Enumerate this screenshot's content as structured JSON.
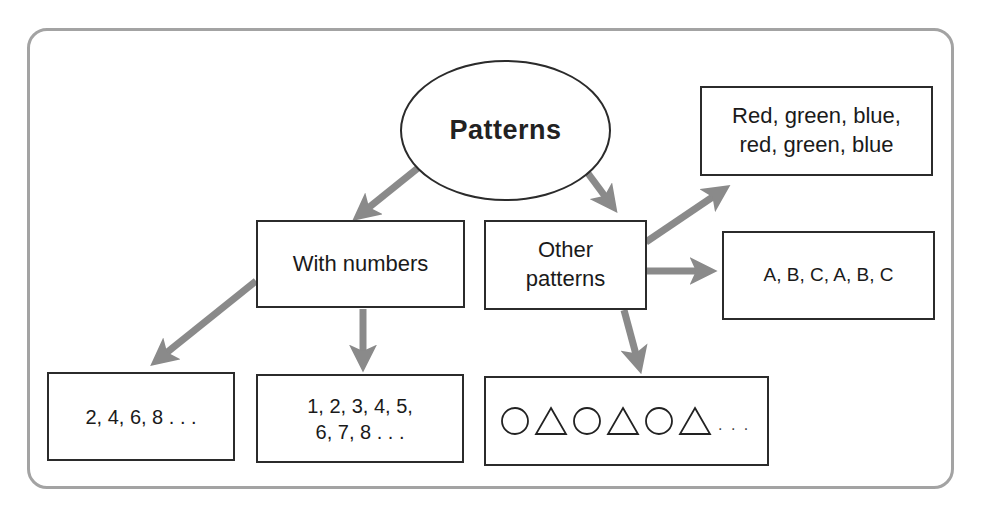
{
  "diagram": {
    "root": {
      "label": "Patterns"
    },
    "branches": [
      {
        "label": "With numbers",
        "examples": [
          {
            "label": "2, 4, 6, 8 . . ."
          },
          {
            "line1": "1, 2, 3, 4, 5,",
            "line2": "6, 7, 8 . . ."
          }
        ]
      },
      {
        "label_line1": "Other",
        "label_line2": "patterns",
        "examples": [
          {
            "line1": "Red, green, blue,",
            "line2": "red, green, blue"
          },
          {
            "label": "A, B, C, A, B, C"
          },
          {
            "shapes": [
              "circle",
              "triangle",
              "circle",
              "triangle",
              "circle",
              "triangle"
            ],
            "ellipsis": ". . ."
          }
        ]
      }
    ],
    "colors": {
      "frame": "#a3a3a3",
      "arrow": "#8a8a8a",
      "box_border": "#2b2b2b",
      "text": "#1a1a1a"
    }
  }
}
